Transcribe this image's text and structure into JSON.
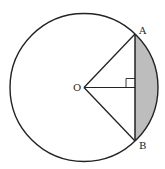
{
  "diagram": {
    "type": "geometry",
    "colors": {
      "stroke": "#222222",
      "shade": "#bdbdbd",
      "background": "#ffffff"
    },
    "circle": {
      "center": {
        "x": 84,
        "y": 87.5
      },
      "radius": 74
    },
    "points": {
      "O": {
        "label": "O",
        "x": 84,
        "y": 87.5
      },
      "A": {
        "label": "A",
        "x": 135,
        "y": 34
      },
      "B": {
        "label": "B",
        "x": 135,
        "y": 141
      }
    },
    "labels": {
      "O": "O",
      "A": "A",
      "B": "B"
    },
    "segments": [
      "OA",
      "OB",
      "AB",
      "O-foot"
    ],
    "right_angle_marker": {
      "at": "foot of perpendicular from O on AB",
      "size": 9
    },
    "shaded_region": "minor segment between chord AB and arc AB"
  }
}
